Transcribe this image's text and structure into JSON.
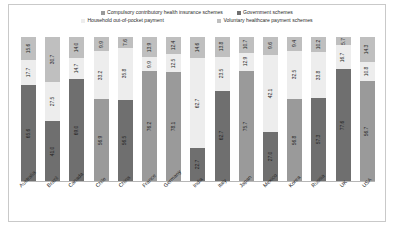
{
  "legend": {
    "items": [
      {
        "label": "Compulsory contributory health insurance schemes",
        "color": "#9a9a9a",
        "key": "compulsory"
      },
      {
        "label": "Government schemes",
        "color": "#6f6f6f",
        "key": "government"
      },
      {
        "label": "Household out-of-pocket payment",
        "color": "#ededed",
        "key": "household"
      },
      {
        "label": "Voluntary healthcare payment schemes",
        "color": "#bfbfbf",
        "key": "voluntary"
      }
    ]
  },
  "chart_data": {
    "type": "bar",
    "subtype": "stacked-100-percent",
    "title": "",
    "subtitle": "",
    "xlabel": "",
    "ylabel": "",
    "ylim": [
      0,
      100
    ],
    "grid": false,
    "legend_position": "top",
    "stack_order_bottom_to_top": [
      "compulsory_or_government",
      "household",
      "voluntary"
    ],
    "categories": [
      "Australia",
      "Brazil",
      "Canada",
      "Chile",
      "China",
      "France",
      "Germany",
      "India",
      "Italy",
      "Japan",
      "Mexico",
      "Korea",
      "Russia",
      "UK",
      "USA"
    ],
    "series": [
      {
        "name": "Compulsory contributory health insurance schemes",
        "color": "#9a9a9a",
        "values": [
          null,
          null,
          null,
          56.9,
          null,
          76.2,
          78.1,
          null,
          null,
          75.7,
          null,
          56.8,
          null,
          null,
          56.7
        ]
      },
      {
        "name": "Government schemes",
        "color": "#6f6f6f",
        "values": [
          65.6,
          41.0,
          69.0,
          null,
          56.5,
          null,
          null,
          22.7,
          62.7,
          null,
          27.0,
          null,
          57.3,
          77.6,
          null
        ]
      },
      {
        "name": "Household out-of-pocket payment",
        "color": "#ededed",
        "values": [
          17.7,
          27.5,
          14.7,
          33.2,
          35.8,
          9.9,
          12.5,
          62.7,
          23.5,
          12.9,
          42.1,
          33.8,
          32.5,
          16.7,
          10.8
        ]
      },
      {
        "name": "Voluntary healthcare payment schemes",
        "color": "#bfbfbf",
        "values": [
          15.6,
          30.7,
          14.0,
          9.9,
          7.6,
          13.9,
          12.4,
          14.6,
          13.8,
          10.7,
          9.6,
          9.4,
          10.2,
          5.7,
          14.3
        ]
      }
    ],
    "bar_labels": [
      {
        "category": "Australia",
        "bottom": "65.6",
        "middle": "17.7",
        "top": "15.6"
      },
      {
        "category": "Brazil",
        "bottom": "41.0",
        "middle": "27.5",
        "top": "30.7"
      },
      {
        "category": "Canada",
        "bottom": "69.0",
        "middle": "14.7",
        "top": "14.0"
      },
      {
        "category": "Chile",
        "bottom": "56.9",
        "middle": "33.2",
        "top": "9.9"
      },
      {
        "category": "China",
        "bottom": "56.5",
        "middle": "35.8",
        "top": "7.6"
      },
      {
        "category": "France",
        "bottom": "76.2",
        "middle": "9.9",
        "top": "13.9"
      },
      {
        "category": "Germany",
        "bottom": "78.1",
        "middle": "12.5",
        "top": "12.4"
      },
      {
        "category": "India",
        "bottom": "22.7",
        "middle": "62.7",
        "top": "14.6"
      },
      {
        "category": "Italy",
        "bottom": "62.7",
        "middle": "23.5",
        "top": "13.8"
      },
      {
        "category": "Japan",
        "bottom": "75.7",
        "middle": "12.9",
        "top": "10.7"
      },
      {
        "category": "Mexico",
        "bottom": "27.0",
        "middle": "42.1",
        "top": "9.6"
      },
      {
        "category": "Korea",
        "bottom": "56.8",
        "middle": "32.5",
        "top": "9.4"
      },
      {
        "category": "Russia",
        "bottom": "57.3",
        "middle": "33.8",
        "top": "10.2"
      },
      {
        "category": "UK",
        "bottom": "77.6",
        "middle": "16.7",
        "top": "5.7"
      },
      {
        "category": "USA",
        "bottom": "56.7",
        "middle": "10.8",
        "top": "14.3"
      }
    ]
  }
}
